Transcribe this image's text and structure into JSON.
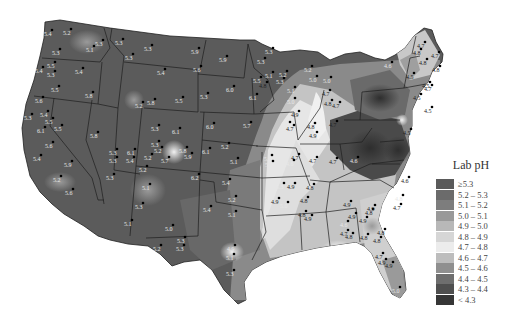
{
  "map": {
    "title": "Lab pH",
    "region": "Contiguous United States",
    "legend": {
      "title": "Lab pH",
      "items": [
        {
          "label": "≥5.3",
          "color": "#5a5a5a"
        },
        {
          "label": "5.2 – 5.3",
          "color": "#6b6b6b"
        },
        {
          "label": "5.1 – 5.2",
          "color": "#7d7d7d"
        },
        {
          "label": "5.0 – 5.1",
          "color": "#999999"
        },
        {
          "label": "4.9 – 5.0",
          "color": "#b8b8b8"
        },
        {
          "label": "4.8 – 4.9",
          "color": "#d6d6d6"
        },
        {
          "label": "4.7 – 4.8",
          "color": "#ececec"
        },
        {
          "label": "4.6 – 4.7",
          "color": "#bdbdbd"
        },
        {
          "label": "4.5 – 4.6",
          "color": "#8f8f8f"
        },
        {
          "label": "4.4 – 4.5",
          "color": "#6e6e6e"
        },
        {
          "label": "4.3 – 4.4",
          "color": "#4f4f4f"
        },
        {
          "label": "< 4.3",
          "color": "#363636"
        }
      ]
    },
    "site_labels": [
      {
        "x": 49,
        "y": 36,
        "v": "5.4"
      },
      {
        "x": 68,
        "y": 35,
        "v": "5.2"
      },
      {
        "x": 100,
        "y": 46,
        "v": "5.3"
      },
      {
        "x": 91,
        "y": 52,
        "v": "5.1"
      },
      {
        "x": 57,
        "y": 55,
        "v": "5.3"
      },
      {
        "x": 52,
        "y": 68,
        "v": "5.5"
      },
      {
        "x": 40,
        "y": 73,
        "v": "5.4"
      },
      {
        "x": 52,
        "y": 77,
        "v": "5.3"
      },
      {
        "x": 80,
        "y": 74,
        "v": "5.4"
      },
      {
        "x": 56,
        "y": 92,
        "v": "5.5"
      },
      {
        "x": 90,
        "y": 98,
        "v": "5.8"
      },
      {
        "x": 40,
        "y": 103,
        "v": "5.6"
      },
      {
        "x": 29,
        "y": 120,
        "v": "5.3"
      },
      {
        "x": 45,
        "y": 117,
        "v": "5.4"
      },
      {
        "x": 50,
        "y": 124,
        "v": "5.5"
      },
      {
        "x": 42,
        "y": 133,
        "v": "6.1"
      },
      {
        "x": 59,
        "y": 131,
        "v": "5.5"
      },
      {
        "x": 50,
        "y": 148,
        "v": "5.6"
      },
      {
        "x": 38,
        "y": 161,
        "v": "5.4"
      },
      {
        "x": 69,
        "y": 167,
        "v": "5.9"
      },
      {
        "x": 95,
        "y": 138,
        "v": "5.8"
      },
      {
        "x": 114,
        "y": 155,
        "v": "5.3"
      },
      {
        "x": 58,
        "y": 182,
        "v": "5.2"
      },
      {
        "x": 70,
        "y": 195,
        "v": "5.6"
      },
      {
        "x": 111,
        "y": 180,
        "v": "5.3"
      },
      {
        "x": 120,
        "y": 45,
        "v": "5.3"
      },
      {
        "x": 149,
        "y": 51,
        "v": "5.3"
      },
      {
        "x": 130,
        "y": 60,
        "v": "5.3"
      },
      {
        "x": 162,
        "y": 75,
        "v": "5.4"
      },
      {
        "x": 140,
        "y": 108,
        "v": "5.2"
      },
      {
        "x": 152,
        "y": 105,
        "v": "5.8"
      },
      {
        "x": 180,
        "y": 103,
        "v": "5.5"
      },
      {
        "x": 196,
        "y": 54,
        "v": "5.9"
      },
      {
        "x": 224,
        "y": 62,
        "v": "5.9"
      },
      {
        "x": 198,
        "y": 72,
        "v": "5.6"
      },
      {
        "x": 205,
        "y": 99,
        "v": "5.3"
      },
      {
        "x": 231,
        "y": 92,
        "v": "6.0"
      },
      {
        "x": 254,
        "y": 100,
        "v": "6.1"
      },
      {
        "x": 248,
        "y": 128,
        "v": "5.7"
      },
      {
        "x": 211,
        "y": 129,
        "v": "6.0"
      },
      {
        "x": 132,
        "y": 155,
        "v": "6.1"
      },
      {
        "x": 131,
        "y": 163,
        "v": "5.4"
      },
      {
        "x": 114,
        "y": 163,
        "v": "5.3"
      },
      {
        "x": 156,
        "y": 131,
        "v": "5.3"
      },
      {
        "x": 177,
        "y": 134,
        "v": "6.1"
      },
      {
        "x": 156,
        "y": 147,
        "v": "5.3"
      },
      {
        "x": 159,
        "y": 153,
        "v": "5.2"
      },
      {
        "x": 184,
        "y": 153,
        "v": "5.8"
      },
      {
        "x": 149,
        "y": 160,
        "v": "5.2"
      },
      {
        "x": 166,
        "y": 163,
        "v": "5.7"
      },
      {
        "x": 189,
        "y": 159,
        "v": "5.9"
      },
      {
        "x": 207,
        "y": 154,
        "v": "6.1"
      },
      {
        "x": 144,
        "y": 172,
        "v": "5.2"
      },
      {
        "x": 147,
        "y": 190,
        "v": "5.1"
      },
      {
        "x": 196,
        "y": 180,
        "v": "6.2"
      },
      {
        "x": 226,
        "y": 149,
        "v": "5.2"
      },
      {
        "x": 235,
        "y": 164,
        "v": "5.1"
      },
      {
        "x": 227,
        "y": 185,
        "v": "5.4"
      },
      {
        "x": 233,
        "y": 202,
        "v": "5.2"
      },
      {
        "x": 233,
        "y": 217,
        "v": "5.1"
      },
      {
        "x": 140,
        "y": 209,
        "v": "5.3"
      },
      {
        "x": 129,
        "y": 226,
        "v": "5.1"
      },
      {
        "x": 208,
        "y": 212,
        "v": "5.4"
      },
      {
        "x": 170,
        "y": 231,
        "v": "5.0"
      },
      {
        "x": 182,
        "y": 243,
        "v": "5.3"
      },
      {
        "x": 181,
        "y": 251,
        "v": "5.3"
      },
      {
        "x": 158,
        "y": 251,
        "v": "5.2"
      },
      {
        "x": 232,
        "y": 251,
        "v": "4.9"
      },
      {
        "x": 231,
        "y": 260,
        "v": "5.1"
      },
      {
        "x": 231,
        "y": 276,
        "v": "5.3"
      },
      {
        "x": 270,
        "y": 54,
        "v": "5.3"
      },
      {
        "x": 262,
        "y": 64,
        "v": "5.3"
      },
      {
        "x": 270,
        "y": 78,
        "v": "5.1"
      },
      {
        "x": 264,
        "y": 88,
        "v": "4.8"
      },
      {
        "x": 258,
        "y": 83,
        "v": "5.5"
      },
      {
        "x": 281,
        "y": 84,
        "v": "5.3"
      },
      {
        "x": 292,
        "y": 93,
        "v": "5.1"
      },
      {
        "x": 292,
        "y": 104,
        "v": "5.0"
      },
      {
        "x": 296,
        "y": 117,
        "v": "4.9"
      },
      {
        "x": 287,
        "y": 128,
        "v": "5.0"
      },
      {
        "x": 284,
        "y": 77,
        "v": "5.2"
      },
      {
        "x": 309,
        "y": 72,
        "v": "5.2"
      },
      {
        "x": 314,
        "y": 82,
        "v": "5.0"
      },
      {
        "x": 328,
        "y": 83,
        "v": "5.0"
      },
      {
        "x": 327,
        "y": 96,
        "v": "4.7"
      },
      {
        "x": 329,
        "y": 106,
        "v": "4.8"
      },
      {
        "x": 337,
        "y": 108,
        "v": "4.7"
      },
      {
        "x": 334,
        "y": 127,
        "v": "4.7"
      },
      {
        "x": 312,
        "y": 129,
        "v": "4.8"
      },
      {
        "x": 314,
        "y": 138,
        "v": "4.9"
      },
      {
        "x": 291,
        "y": 131,
        "v": "4.7"
      },
      {
        "x": 296,
        "y": 160,
        "v": "4.7"
      },
      {
        "x": 291,
        "y": 166,
        "v": "4.6"
      },
      {
        "x": 314,
        "y": 163,
        "v": "4.7"
      },
      {
        "x": 334,
        "y": 164,
        "v": "4.7"
      },
      {
        "x": 355,
        "y": 163,
        "v": "4.6"
      },
      {
        "x": 269,
        "y": 161,
        "v": "5.2"
      },
      {
        "x": 270,
        "y": 167,
        "v": "5.1"
      },
      {
        "x": 281,
        "y": 189,
        "v": "5.3"
      },
      {
        "x": 292,
        "y": 189,
        "v": "4.9"
      },
      {
        "x": 311,
        "y": 190,
        "v": "4.8"
      },
      {
        "x": 276,
        "y": 204,
        "v": "4.9"
      },
      {
        "x": 285,
        "y": 208,
        "v": "5.0"
      },
      {
        "x": 305,
        "y": 203,
        "v": "4.8"
      },
      {
        "x": 303,
        "y": 217,
        "v": "4.8"
      },
      {
        "x": 309,
        "y": 221,
        "v": "4.9"
      },
      {
        "x": 348,
        "y": 207,
        "v": "4.9"
      },
      {
        "x": 370,
        "y": 215,
        "v": "4.8"
      },
      {
        "x": 364,
        "y": 223,
        "v": "4.9"
      },
      {
        "x": 365,
        "y": 240,
        "v": "4.8"
      },
      {
        "x": 382,
        "y": 235,
        "v": "4.8"
      },
      {
        "x": 398,
        "y": 210,
        "v": "4.7"
      },
      {
        "x": 406,
        "y": 183,
        "v": "4.6"
      },
      {
        "x": 400,
        "y": 201,
        "v": "4.8"
      },
      {
        "x": 372,
        "y": 211,
        "v": "4.9"
      },
      {
        "x": 345,
        "y": 236,
        "v": "4.7"
      },
      {
        "x": 350,
        "y": 239,
        "v": "4.8"
      },
      {
        "x": 383,
        "y": 265,
        "v": "4.9"
      },
      {
        "x": 397,
        "y": 293,
        "v": "5.0"
      },
      {
        "x": 408,
        "y": 135,
        "v": "4.5"
      },
      {
        "x": 411,
        "y": 79,
        "v": "4.5"
      },
      {
        "x": 427,
        "y": 88,
        "v": "4.5"
      },
      {
        "x": 389,
        "y": 68,
        "v": "4.6"
      },
      {
        "x": 424,
        "y": 65,
        "v": "4.8"
      },
      {
        "x": 437,
        "y": 72,
        "v": "4.8"
      },
      {
        "x": 418,
        "y": 55,
        "v": "4.8"
      },
      {
        "x": 436,
        "y": 58,
        "v": "4.7"
      },
      {
        "x": 422,
        "y": 48,
        "v": "4.7"
      },
      {
        "x": 429,
        "y": 91,
        "v": "4.7"
      },
      {
        "x": 429,
        "y": 113,
        "v": "4.5"
      },
      {
        "x": 418,
        "y": 100,
        "v": "4.5"
      },
      {
        "x": 353,
        "y": 219,
        "v": "4.9"
      },
      {
        "x": 345,
        "y": 227,
        "v": "4.6"
      },
      {
        "x": 378,
        "y": 243,
        "v": "4.8"
      },
      {
        "x": 390,
        "y": 268,
        "v": "4.9"
      },
      {
        "x": 380,
        "y": 259,
        "v": "4.7"
      }
    ]
  }
}
